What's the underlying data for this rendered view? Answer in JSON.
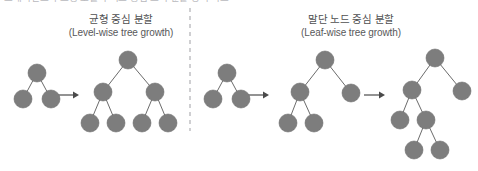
{
  "figure": {
    "width": 478,
    "height": 171,
    "background": "#ffffff",
    "top_clipped_caption": "그래디언트 부스팅 모델의 리프 중심 트리 분할 방식 비교"
  },
  "colors": {
    "node_fill": "#7d7d7d",
    "node_stroke": "#6e6e6e",
    "edge": "#6b6b6b",
    "arrow": "#4a4a4a",
    "divider": "#b0b0b4",
    "heading_ko": "#4f4f51",
    "heading_en": "#58585a"
  },
  "panels": [
    {
      "id": "level-wise",
      "title_ko": "균형 중심 분할",
      "title_en": "(Level-wise tree growth)"
    },
    {
      "id": "leaf-wise",
      "title_ko": "말단 노드 중심 분할",
      "title_en": "(Leaf-wise tree growth)"
    }
  ],
  "divider": {
    "x": 190,
    "y1": 8,
    "y2": 131
  },
  "node_radius": 9,
  "arrows": [
    {
      "name": "arrow-level-wise-step-1",
      "x1": 58,
      "x2": 79,
      "y": 95
    },
    {
      "name": "arrow-leaf-wise-step-1",
      "x1": 248,
      "x2": 269,
      "y": 95
    },
    {
      "name": "arrow-leaf-wise-step-2",
      "x1": 364,
      "x2": 385,
      "y": 95
    }
  ],
  "trees": [
    {
      "name": "tree-level-wise-before",
      "panel": "level-wise",
      "nodes": [
        {
          "id": "r",
          "x": 37,
          "y": 73
        },
        {
          "id": "l",
          "x": 23,
          "y": 99
        },
        {
          "id": "rr",
          "x": 51,
          "y": 99
        }
      ],
      "edges": [
        [
          "r",
          "l"
        ],
        [
          "r",
          "rr"
        ]
      ]
    },
    {
      "name": "tree-level-wise-after",
      "panel": "level-wise",
      "nodes": [
        {
          "id": "r",
          "x": 128,
          "y": 60
        },
        {
          "id": "a",
          "x": 103,
          "y": 92
        },
        {
          "id": "b",
          "x": 155,
          "y": 92
        },
        {
          "id": "a1",
          "x": 90,
          "y": 123
        },
        {
          "id": "a2",
          "x": 116,
          "y": 123
        },
        {
          "id": "b1",
          "x": 142,
          "y": 123
        },
        {
          "id": "b2",
          "x": 168,
          "y": 123
        }
      ],
      "edges": [
        [
          "r",
          "a"
        ],
        [
          "r",
          "b"
        ],
        [
          "a",
          "a1"
        ],
        [
          "a",
          "a2"
        ],
        [
          "b",
          "b1"
        ],
        [
          "b",
          "b2"
        ]
      ]
    },
    {
      "name": "tree-leaf-wise-step-1",
      "panel": "leaf-wise",
      "nodes": [
        {
          "id": "r",
          "x": 227,
          "y": 73
        },
        {
          "id": "l",
          "x": 213,
          "y": 99
        },
        {
          "id": "rr",
          "x": 241,
          "y": 99
        }
      ],
      "edges": [
        [
          "r",
          "l"
        ],
        [
          "r",
          "rr"
        ]
      ]
    },
    {
      "name": "tree-leaf-wise-step-2",
      "panel": "leaf-wise",
      "nodes": [
        {
          "id": "r",
          "x": 325,
          "y": 60
        },
        {
          "id": "a",
          "x": 300,
          "y": 92
        },
        {
          "id": "b",
          "x": 351,
          "y": 93
        },
        {
          "id": "a1",
          "x": 288,
          "y": 123
        },
        {
          "id": "a2",
          "x": 314,
          "y": 123
        }
      ],
      "edges": [
        [
          "r",
          "a"
        ],
        [
          "r",
          "b"
        ],
        [
          "a",
          "a1"
        ],
        [
          "a",
          "a2"
        ]
      ]
    },
    {
      "name": "tree-leaf-wise-step-3",
      "panel": "leaf-wise",
      "nodes": [
        {
          "id": "r",
          "x": 435,
          "y": 58
        },
        {
          "id": "a",
          "x": 412,
          "y": 90
        },
        {
          "id": "b",
          "x": 462,
          "y": 91
        },
        {
          "id": "a1",
          "x": 400,
          "y": 120
        },
        {
          "id": "a2",
          "x": 426,
          "y": 120
        },
        {
          "id": "a2a",
          "x": 414,
          "y": 150
        },
        {
          "id": "a2b",
          "x": 440,
          "y": 150
        }
      ],
      "edges": [
        [
          "r",
          "a"
        ],
        [
          "r",
          "b"
        ],
        [
          "a",
          "a1"
        ],
        [
          "a",
          "a2"
        ],
        [
          "a2",
          "a2a"
        ],
        [
          "a2",
          "a2b"
        ]
      ]
    }
  ]
}
